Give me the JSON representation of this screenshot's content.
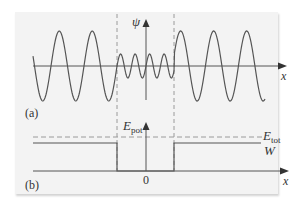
{
  "figure": {
    "panel_a": {
      "label": "(a)",
      "y_axis_label": "ψ",
      "x_axis_label": "x"
    },
    "panel_b": {
      "label": "(b)",
      "y_axis_label_main": "E",
      "y_axis_label_sub": "pot",
      "x_axis_label": "x",
      "origin_label": "0",
      "e_tot_main": "E",
      "e_tot_sub": "tot",
      "w_label": "W"
    },
    "colors": {
      "background": "#f3f3f3",
      "curve": "#555555",
      "axis": "#555555",
      "dashed": "#999999"
    }
  }
}
